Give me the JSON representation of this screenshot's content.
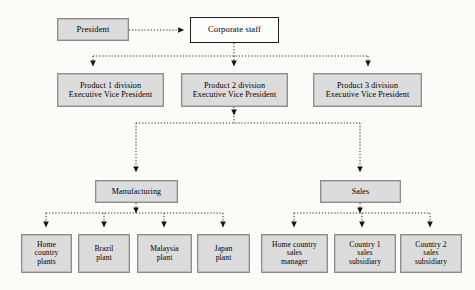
{
  "diagram": {
    "background_color": "#fbfbf8",
    "shaded_fill": "#dcdcdc",
    "shaded_border": "#8d8d8d",
    "plain_fill": "#fdfdfc",
    "plain_border": "#1d1d1d",
    "connector_style": "dotted",
    "connector_color": "#2a2a2a"
  },
  "nodes": {
    "president": {
      "label": "President",
      "style": "shaded"
    },
    "corporate_staff": {
      "label": "Corporate staff",
      "style": "plain"
    },
    "division1": {
      "label": "Product 1 division\nExecutive Vice President",
      "style": "shaded"
    },
    "division2": {
      "label": "Product 2 division\nExecutive Vice President",
      "style": "shaded"
    },
    "division3": {
      "label": "Product 3 division\nExecutive Vice President",
      "style": "shaded"
    },
    "manufacturing": {
      "label": "Manufacturing",
      "style": "shaded"
    },
    "sales": {
      "label": "Sales",
      "style": "shaded"
    },
    "home_country_plants": {
      "label": "Home\ncountry\nplants",
      "style": "shaded"
    },
    "brazil_plant": {
      "label": "Brazil\nplant",
      "style": "shaded"
    },
    "malaysia_plant": {
      "label": "Malaysia\nplant",
      "style": "shaded"
    },
    "japan_plant": {
      "label": "Japan\nplant",
      "style": "shaded"
    },
    "home_country_sales_manager": {
      "label": "Home country\nsales\nmanager",
      "style": "shaded"
    },
    "country1_sales_subsidiary": {
      "label": "Country 1\nsales\nsubsidiary",
      "style": "shaded"
    },
    "country2_sales_subsidiary": {
      "label": "Country 2\nsales\nsubsidiary",
      "style": "shaded"
    }
  },
  "edges": [
    {
      "from": "president",
      "to": "corporate_staff"
    },
    {
      "from": "corporate_staff",
      "to": "division1"
    },
    {
      "from": "corporate_staff",
      "to": "division2"
    },
    {
      "from": "corporate_staff",
      "to": "division3"
    },
    {
      "from": "division2",
      "to": "manufacturing"
    },
    {
      "from": "division2",
      "to": "sales"
    },
    {
      "from": "manufacturing",
      "to": "home_country_plants"
    },
    {
      "from": "manufacturing",
      "to": "brazil_plant"
    },
    {
      "from": "manufacturing",
      "to": "malaysia_plant"
    },
    {
      "from": "manufacturing",
      "to": "japan_plant"
    },
    {
      "from": "sales",
      "to": "home_country_sales_manager"
    },
    {
      "from": "sales",
      "to": "country1_sales_subsidiary"
    },
    {
      "from": "sales",
      "to": "country2_sales_subsidiary"
    }
  ]
}
